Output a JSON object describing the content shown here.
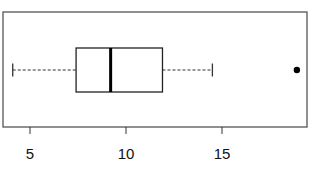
{
  "chart_data": {
    "type": "boxplot",
    "orientation": "horizontal",
    "title": "",
    "xlabel": "",
    "ylabel": "",
    "xlim": [
      3.6,
      19.3
    ],
    "x_ticks": [
      5,
      10,
      15
    ],
    "x_tick_labels": [
      "5",
      "10",
      "15"
    ],
    "grid": false,
    "legend": null,
    "box": {
      "whisker_low": 4.1,
      "q1": 7.4,
      "median": 9.2,
      "q3": 11.9,
      "whisker_high": 14.5,
      "outliers": [
        18.9
      ]
    },
    "colors": {
      "box_line": "#111111",
      "median_line": "#000000",
      "whisker": "#333333",
      "outlier": "#000000",
      "frame": "#555555"
    }
  }
}
